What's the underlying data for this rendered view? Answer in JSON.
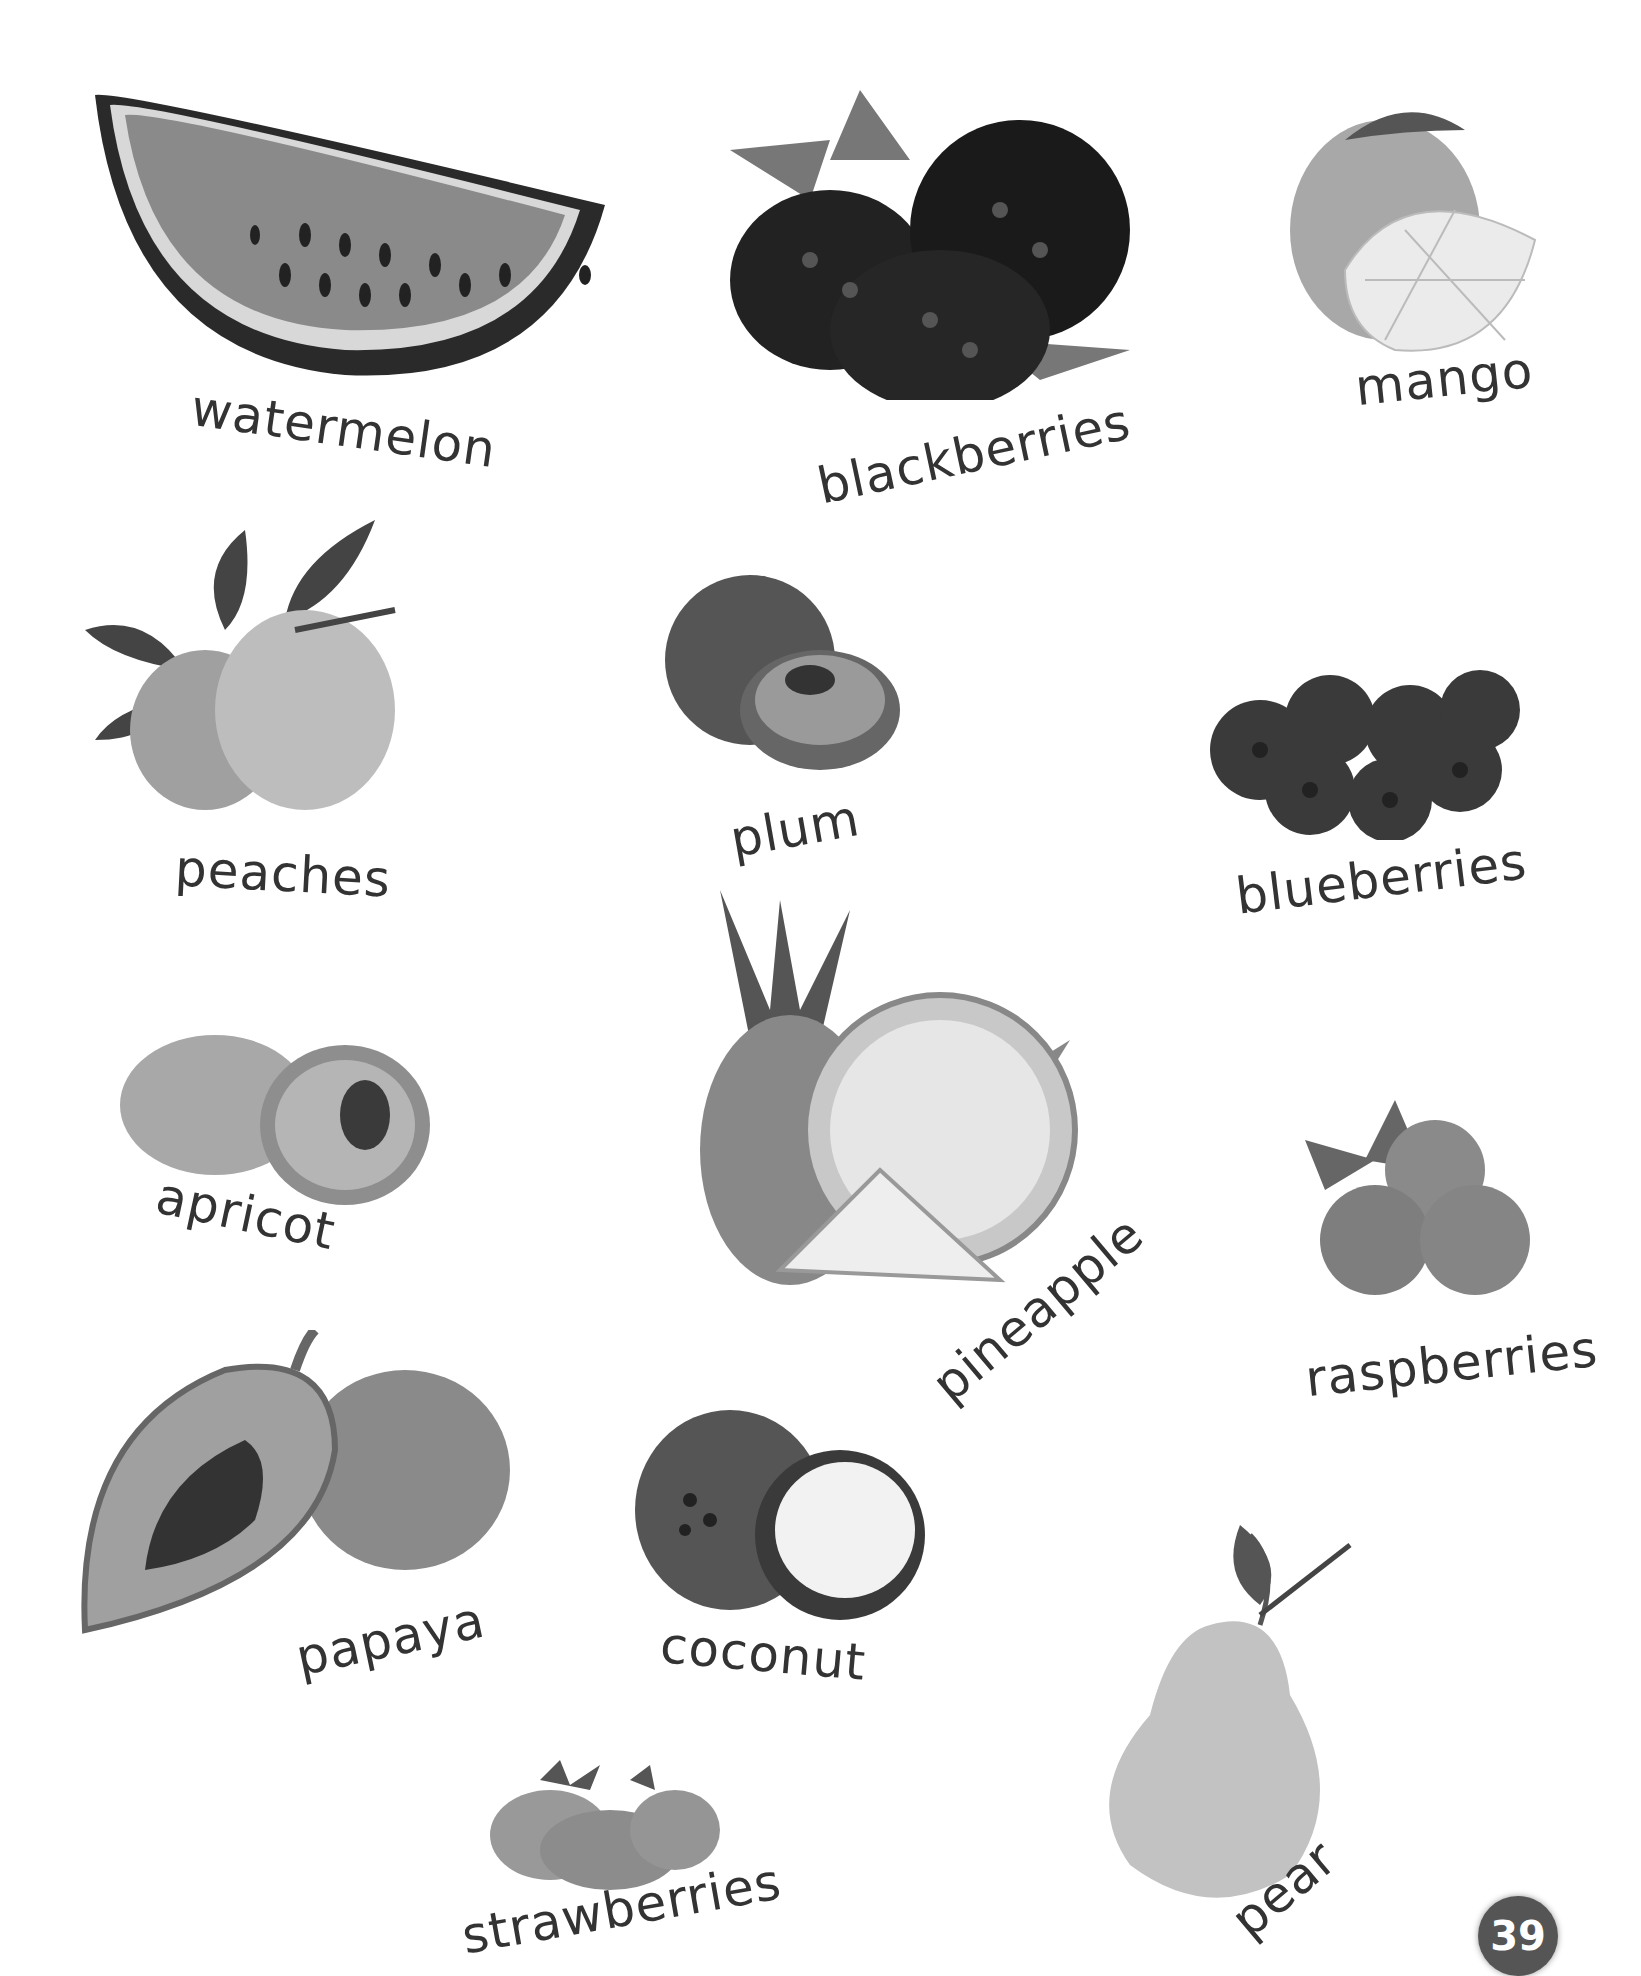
{
  "page": {
    "number": "39",
    "style": "grayscale",
    "colors": {
      "label": "#333333",
      "badge": "#555555",
      "badge_text": "#ffffff"
    }
  },
  "fruits": [
    {
      "id": "watermelon",
      "label": "watermelon"
    },
    {
      "id": "blackberries",
      "label": "blackberries"
    },
    {
      "id": "mango",
      "label": "mango"
    },
    {
      "id": "peaches",
      "label": "peaches"
    },
    {
      "id": "plum",
      "label": "plum"
    },
    {
      "id": "blueberries",
      "label": "blueberries"
    },
    {
      "id": "apricot",
      "label": "apricot"
    },
    {
      "id": "pineapple",
      "label": "pineapple"
    },
    {
      "id": "raspberries",
      "label": "raspberries"
    },
    {
      "id": "papaya",
      "label": "papaya"
    },
    {
      "id": "coconut",
      "label": "coconut"
    },
    {
      "id": "pear",
      "label": "pear"
    },
    {
      "id": "strawberries",
      "label": "strawberries"
    }
  ]
}
